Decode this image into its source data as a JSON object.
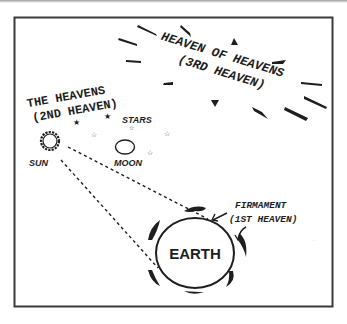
{
  "diagram": {
    "third_heaven": {
      "line1": "HEAVEN OF HEAVENS",
      "line2": "(3RD HEAVEN)"
    },
    "second_heaven": {
      "line1": "THE HEAVENS",
      "line2": "(2ND HEAVEN)"
    },
    "first_heaven": {
      "line1": "FIRMAMENT",
      "line2": "(1ST HEAVEN)"
    },
    "labels": {
      "stars": "STARS",
      "sun": "SUN",
      "moon": "MOON",
      "earth": "EARTH"
    },
    "colors": {
      "ink": "#1e1e1e",
      "frame": "#3a3a3a",
      "background": "#ffffff"
    }
  }
}
